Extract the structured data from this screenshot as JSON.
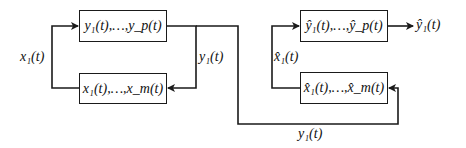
{
  "diagram": {
    "left_system": {
      "top_block": "y₁(t),…,y_p(t)",
      "bottom_block": "x₁(t),…,x_m(t)",
      "feedback_label": "x₁(t)",
      "branch_label": "y₁(t)"
    },
    "right_system": {
      "top_block": "ŷ₁(t),…,ŷ_p(t)",
      "bottom_block": "x̂₁(t),…,x̂_m(t)",
      "feedback_label": "x̂₁(t)",
      "output_label": "ŷ₁(t)"
    },
    "connection_label": "y₁(t)",
    "line_color": "#1a1a1a"
  }
}
